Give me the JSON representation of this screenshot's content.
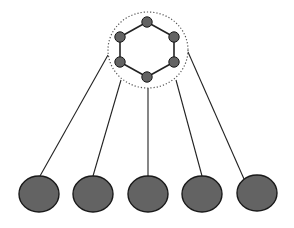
{
  "diagram": {
    "colors": {
      "background": "#ffffff",
      "node_fill": "#636363",
      "node_stroke": "#1a1a1a",
      "edge": "#222222",
      "boundary": "#555555"
    },
    "cluster": {
      "boundary": {
        "cx": 148,
        "cy": 50,
        "rx": 40,
        "ry": 38,
        "style": "dotted"
      },
      "nodes": [
        {
          "id": "h1",
          "cx": 147,
          "cy": 22
        },
        {
          "id": "h2",
          "cx": 174,
          "cy": 37
        },
        {
          "id": "h3",
          "cx": 174,
          "cy": 62
        },
        {
          "id": "h4",
          "cx": 147,
          "cy": 77
        },
        {
          "id": "h5",
          "cx": 120,
          "cy": 62
        },
        {
          "id": "h6",
          "cx": 120,
          "cy": 37
        }
      ],
      "edges": [
        [
          "h1",
          "h2"
        ],
        [
          "h2",
          "h3"
        ],
        [
          "h3",
          "h4"
        ],
        [
          "h4",
          "h5"
        ],
        [
          "h5",
          "h6"
        ],
        [
          "h6",
          "h1"
        ]
      ]
    },
    "leaf_nodes": [
      {
        "id": "l1",
        "cx": 39,
        "cy": 194,
        "rx": 20,
        "ry": 18
      },
      {
        "id": "l2",
        "cx": 93,
        "cy": 194,
        "rx": 20,
        "ry": 18
      },
      {
        "id": "l3",
        "cx": 148,
        "cy": 194,
        "rx": 20,
        "ry": 18
      },
      {
        "id": "l4",
        "cx": 202,
        "cy": 194,
        "rx": 20,
        "ry": 18
      },
      {
        "id": "l5",
        "cx": 257,
        "cy": 193,
        "rx": 20,
        "ry": 18
      }
    ],
    "links": [
      {
        "from": [
          108,
          55
        ],
        "to": [
          40,
          176
        ]
      },
      {
        "from": [
          121,
          80
        ],
        "to": [
          93,
          176
        ]
      },
      {
        "from": [
          148,
          88
        ],
        "to": [
          148,
          176
        ]
      },
      {
        "from": [
          176,
          80
        ],
        "to": [
          202,
          176
        ]
      },
      {
        "from": [
          188,
          52
        ],
        "to": [
          244,
          179
        ]
      }
    ]
  }
}
